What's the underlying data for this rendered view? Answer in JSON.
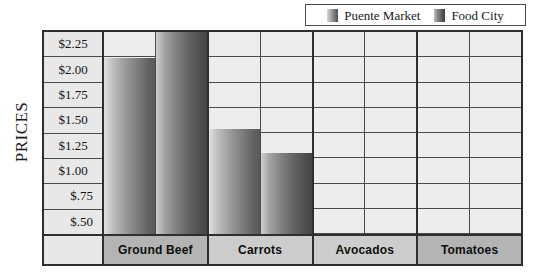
{
  "legend": {
    "position": "top-right",
    "entries": [
      {
        "label": "Puente Market",
        "swatch": "puente-swatch-icon",
        "color": "#7a7a7a"
      },
      {
        "label": "Food City",
        "swatch": "food-city-swatch-icon",
        "color": "#565656"
      }
    ]
  },
  "axis": {
    "y_title": "PRICES",
    "y_ticks": [
      "$2.25",
      "$2.00",
      "$1.75",
      "$1.50",
      "$1.25",
      "$1.00",
      "$.75",
      "$.50"
    ]
  },
  "colors": {
    "frame": "#2e2e2e",
    "gridline": "#4a4a4a",
    "cell_background": "#ededed",
    "tick_background": "#e8e8e8",
    "category_dark": "#b4b4b4",
    "category_light": "#cdcdcd",
    "puente_bar": "#7a7a7a",
    "food_city_bar": "#565656"
  },
  "chart_data": {
    "type": "bar",
    "title": "",
    "subtitle": "",
    "xlabel": "",
    "ylabel": "PRICES",
    "categories": [
      "Ground Beef",
      "Carrots",
      "Avocados",
      "Tomatoes"
    ],
    "series": [
      {
        "name": "Puente Market",
        "values": [
          2.1,
          1.35,
          null,
          null
        ]
      },
      {
        "name": "Food City",
        "values": [
          2.4,
          1.1,
          null,
          null
        ]
      }
    ],
    "ylim": [
      0.25,
      2.375
    ],
    "ytick_values": [
      2.25,
      2.0,
      1.75,
      1.5,
      1.25,
      1.0,
      0.75,
      0.5
    ],
    "ytick_labels": [
      "$2.25",
      "$2.00",
      "$1.75",
      "$1.50",
      "$1.25",
      "$1.00",
      "$.75",
      "$.50"
    ],
    "grid": true,
    "legend_position": "top-right"
  },
  "categories_render": [
    {
      "label": "Ground Beef",
      "shade": "dark",
      "bars": [
        {
          "series": "Puente Market",
          "value": 2.1
        },
        {
          "series": "Food City",
          "value": 2.4
        }
      ]
    },
    {
      "label": "Carrots",
      "shade": "light",
      "bars": [
        {
          "series": "Puente Market",
          "value": 1.35
        },
        {
          "series": "Food City",
          "value": 1.1
        }
      ]
    },
    {
      "label": "Avocados",
      "shade": "light",
      "bars": [
        {
          "series": "Puente Market",
          "value": null
        },
        {
          "series": "Food City",
          "value": null
        }
      ]
    },
    {
      "label": "Tomatoes",
      "shade": "dark",
      "bars": [
        {
          "series": "Puente Market",
          "value": null
        },
        {
          "series": "Food City",
          "value": null
        }
      ]
    }
  ]
}
